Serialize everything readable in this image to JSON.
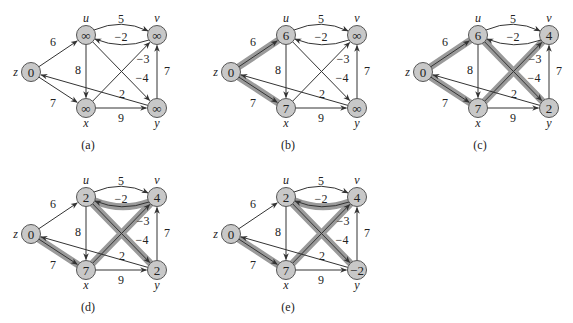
{
  "figure": {
    "node_fill": "#c8c8c8",
    "node_stroke": "#555555",
    "edge_color": "#333333",
    "highlight_color": "#9a9a9a",
    "nodes": [
      "z",
      "u",
      "v",
      "x",
      "y"
    ],
    "edges": [
      {
        "id": "zu",
        "from": "z",
        "to": "u",
        "weight": "6"
      },
      {
        "id": "zx",
        "from": "z",
        "to": "x",
        "weight": "7"
      },
      {
        "id": "uv",
        "from": "u",
        "to": "v",
        "weight": "5"
      },
      {
        "id": "vu",
        "from": "v",
        "to": "u",
        "weight": "−2"
      },
      {
        "id": "ux",
        "from": "u",
        "to": "x",
        "weight": "8"
      },
      {
        "id": "uy",
        "from": "u",
        "to": "y",
        "weight": "−4"
      },
      {
        "id": "xv",
        "from": "x",
        "to": "v",
        "weight": "−3"
      },
      {
        "id": "xy",
        "from": "x",
        "to": "y",
        "weight": "9"
      },
      {
        "id": "yv",
        "from": "y",
        "to": "v",
        "weight": "7"
      },
      {
        "id": "yz",
        "from": "y",
        "to": "z",
        "weight": "2"
      }
    ],
    "panels": [
      {
        "caption": "(a)",
        "origin": [
          0,
          0
        ],
        "values": {
          "z": "0",
          "u": "∞",
          "v": "∞",
          "x": "∞",
          "y": "∞"
        },
        "highlighted": []
      },
      {
        "caption": "(b)",
        "origin": [
          200,
          0
        ],
        "values": {
          "z": "0",
          "u": "6",
          "v": "∞",
          "x": "7",
          "y": "∞"
        },
        "highlighted": [
          "zu",
          "zx"
        ]
      },
      {
        "caption": "(c)",
        "origin": [
          392,
          0
        ],
        "values": {
          "z": "0",
          "u": "6",
          "v": "4",
          "x": "7",
          "y": "2"
        },
        "highlighted": [
          "zu",
          "zx",
          "xv",
          "uy"
        ]
      },
      {
        "caption": "(d)",
        "origin": [
          0,
          162
        ],
        "values": {
          "z": "0",
          "u": "2",
          "v": "4",
          "x": "7",
          "y": "2"
        },
        "highlighted": [
          "zx",
          "xv",
          "vu",
          "uy"
        ]
      },
      {
        "caption": "(e)",
        "origin": [
          200,
          162
        ],
        "values": {
          "z": "0",
          "u": "2",
          "v": "4",
          "x": "7",
          "y": "−2"
        },
        "highlighted": [
          "zx",
          "xv",
          "vu",
          "uy"
        ]
      }
    ]
  }
}
